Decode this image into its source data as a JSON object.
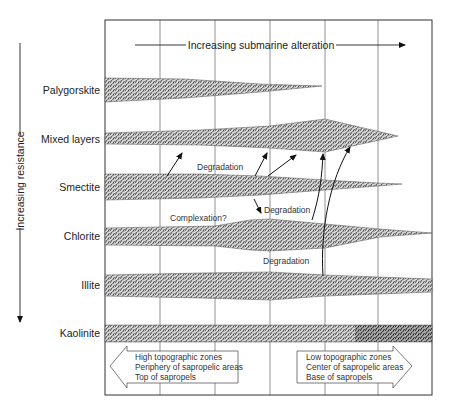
{
  "diagram": {
    "top_axis_label": "Increasing submarine alteration",
    "left_axis_label": "Increasing resistance",
    "minerals": [
      {
        "name": "Palygorskite",
        "y": 90
      },
      {
        "name": "Mixed layers",
        "y": 139
      },
      {
        "name": "Smectite",
        "y": 187
      },
      {
        "name": "Chlorite",
        "y": 236
      },
      {
        "name": "Illite",
        "y": 285
      },
      {
        "name": "Kaolinite",
        "y": 333
      }
    ],
    "annotations": {
      "degradation_1": "Degradation",
      "degradation_2": "Degradation",
      "degradation_3": "Degradation",
      "complexation": "Complexation?"
    },
    "left_zone": {
      "line1": "High topographic zones",
      "line2": "Periphery of sapropelic areas",
      "line3": "Top of sapropels"
    },
    "right_zone": {
      "line1": "Low topographic zones",
      "line2": "Center of sapropelic areas",
      "line3": "Base of sapropels"
    },
    "colors": {
      "ink": "#222222",
      "stipple": "#444444",
      "background": "#ffffff"
    }
  }
}
